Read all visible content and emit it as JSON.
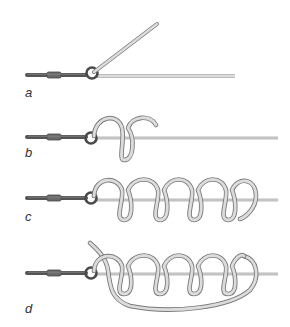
{
  "diagram": {
    "type": "knot-tying-steps",
    "colors": {
      "line_outline": "#7a7a7a",
      "line_fill": "#d9d9d9",
      "swivel_dark": "#555555",
      "swivel_band": "#6a6a6a",
      "ring": "#4a4a4a",
      "label": "#333333"
    },
    "steps": [
      {
        "id": "a",
        "label": "a",
        "coils": 0
      },
      {
        "id": "b",
        "label": "b",
        "coils": 1
      },
      {
        "id": "c",
        "label": "c",
        "coils": 4
      },
      {
        "id": "d",
        "label": "d",
        "coils": 4
      }
    ]
  }
}
